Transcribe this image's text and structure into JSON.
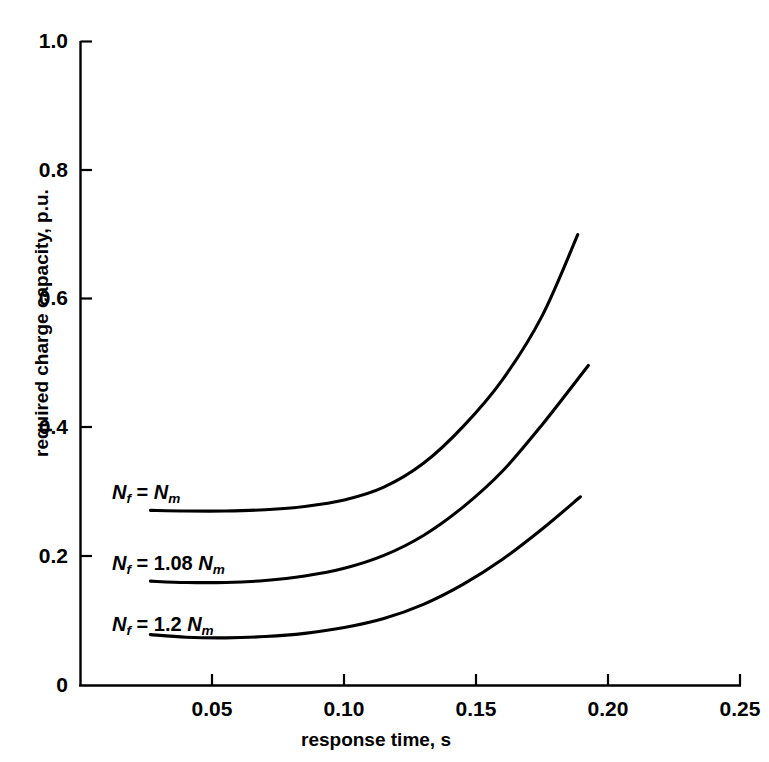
{
  "chart_data": {
    "type": "line",
    "title": "",
    "xlabel": "response time, s",
    "ylabel": "required charge capacity, p.u.",
    "xlim": [
      0,
      0.25
    ],
    "ylim": [
      0,
      1.0
    ],
    "grid": false,
    "legend": "inline-curve-labels",
    "xticks": [
      "0",
      "0.05",
      "0.10",
      "0.15",
      "0.20",
      "0.25"
    ],
    "xtick_values": [
      0,
      0.05,
      0.1,
      0.15,
      0.2,
      0.25
    ],
    "yticks": [
      "0",
      "0.2",
      "0.4",
      "0.6",
      "0.8",
      "1.0"
    ],
    "ytick_values": [
      0,
      0.2,
      0.4,
      0.6,
      0.8,
      1.0
    ],
    "series": [
      {
        "name": "Nf = Nm",
        "label_html": "<i>N</i><sub>f</sub> = <i>N</i><sub>m</sub>",
        "x": [
          0.0265,
          0.04,
          0.055,
          0.07,
          0.085,
          0.1,
          0.115,
          0.13,
          0.145,
          0.16,
          0.175,
          0.1885
        ],
        "y": [
          0.272,
          0.271,
          0.271,
          0.273,
          0.278,
          0.288,
          0.308,
          0.345,
          0.402,
          0.475,
          0.574,
          0.7
        ]
      },
      {
        "name": "Nf = 1.08 Nm",
        "label_html": "<i>N</i><sub>f</sub> = 1.08 <i>N</i><sub>m</sub>",
        "x": [
          0.0265,
          0.04,
          0.055,
          0.07,
          0.085,
          0.1,
          0.115,
          0.13,
          0.145,
          0.16,
          0.175,
          0.1925
        ],
        "y": [
          0.162,
          0.16,
          0.16,
          0.163,
          0.17,
          0.182,
          0.202,
          0.233,
          0.277,
          0.333,
          0.405,
          0.497
        ]
      },
      {
        "name": "Nf = 1.2 Nm",
        "label_html": "<i>N</i><sub>f</sub> = 1.2 <i>N</i><sub>m</sub>",
        "x": [
          0.0265,
          0.04,
          0.055,
          0.07,
          0.085,
          0.1,
          0.115,
          0.13,
          0.145,
          0.16,
          0.175,
          0.1895
        ],
        "y": [
          0.079,
          0.075,
          0.074,
          0.076,
          0.081,
          0.09,
          0.104,
          0.126,
          0.157,
          0.196,
          0.243,
          0.293
        ]
      }
    ],
    "colors": {
      "line": "#000000",
      "axis": "#000000",
      "background": "#ffffff"
    }
  },
  "axes": {
    "y_tick_labels": [
      "1.0",
      "0.8",
      "0.6",
      "0.4",
      "0.2",
      "0"
    ],
    "x_tick_labels": [
      "0.05",
      "0.10",
      "0.15",
      "0.20",
      "0.25"
    ],
    "ylabel": "required charge capacity, p.u.",
    "xlabel": "response time, s"
  }
}
